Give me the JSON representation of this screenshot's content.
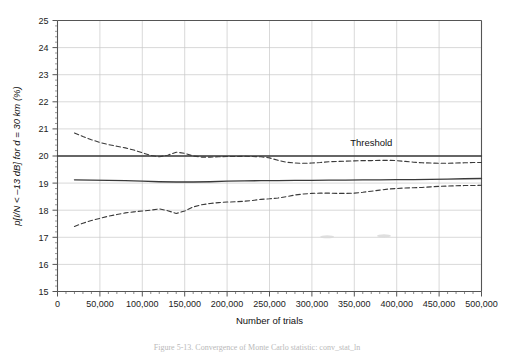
{
  "figure": {
    "caption": "Figure 5-13.  Convergence of Monte Carlo statistic: conv_stat_ln",
    "background_color": "#ffffff"
  },
  "chart_data": {
    "type": "line",
    "title": "",
    "subtitle": "",
    "xlabel": "Number of trials",
    "ylabel": "p[I/N < –13 dB] for d = 30 km (%)",
    "xlim": [
      0,
      500000
    ],
    "ylim": [
      15,
      25
    ],
    "xticks": [
      0,
      50000,
      100000,
      150000,
      200000,
      250000,
      300000,
      350000,
      400000,
      450000,
      500000
    ],
    "xtick_labels": [
      "0",
      "50,000",
      "100,000",
      "150,000",
      "200,000",
      "250,000",
      "300,000",
      "350,000",
      "400,000",
      "450,000",
      "500,000"
    ],
    "x_minor_tick_step": 10000,
    "yticks": [
      15,
      16,
      17,
      18,
      19,
      20,
      21,
      22,
      23,
      24,
      25
    ],
    "ytick_labels": [
      "15",
      "16",
      "17",
      "18",
      "19",
      "20",
      "21",
      "22",
      "23",
      "24",
      "25"
    ],
    "y_minor_tick_step": 0.2,
    "grid": true,
    "grid_color": "#c8c8c8",
    "axis_color": "#555555",
    "legend": "none",
    "annotations": [
      {
        "name": "threshold-label",
        "text": "Threshold",
        "x": 370000,
        "y": 20.38
      }
    ],
    "series": [
      {
        "name": "Threshold",
        "style": "solid",
        "color": "#3a3a3a",
        "width": 1.3,
        "x": [
          0,
          500000
        ],
        "values": [
          20.0,
          20.0
        ]
      },
      {
        "name": "Mean estimate",
        "style": "solid",
        "color": "#3a3a3a",
        "width": 1.3,
        "x": [
          20000,
          40000,
          60000,
          80000,
          100000,
          120000,
          140000,
          160000,
          180000,
          200000,
          220000,
          240000,
          260000,
          280000,
          300000,
          320000,
          340000,
          360000,
          380000,
          400000,
          420000,
          440000,
          460000,
          480000,
          500000
        ],
        "values": [
          19.12,
          19.11,
          19.1,
          19.09,
          19.07,
          19.05,
          19.04,
          19.04,
          19.05,
          19.07,
          19.08,
          19.09,
          19.09,
          19.1,
          19.1,
          19.11,
          19.11,
          19.12,
          19.12,
          19.13,
          19.13,
          19.14,
          19.15,
          19.16,
          19.17
        ]
      },
      {
        "name": "Upper confidence bound",
        "style": "dashed",
        "color": "#3a3a3a",
        "width": 1.1,
        "x": [
          20000,
          30000,
          40000,
          50000,
          60000,
          70000,
          80000,
          90000,
          100000,
          110000,
          120000,
          130000,
          140000,
          150000,
          160000,
          170000,
          180000,
          190000,
          200000,
          210000,
          220000,
          230000,
          240000,
          250000,
          260000,
          270000,
          280000,
          290000,
          300000,
          310000,
          320000,
          330000,
          340000,
          350000,
          360000,
          370000,
          380000,
          390000,
          400000,
          410000,
          420000,
          430000,
          440000,
          450000,
          460000,
          470000,
          480000,
          490000,
          500000
        ],
        "values": [
          20.85,
          20.72,
          20.6,
          20.5,
          20.42,
          20.36,
          20.3,
          20.22,
          20.12,
          20.02,
          19.97,
          20.03,
          20.14,
          20.1,
          20.0,
          19.96,
          19.96,
          19.97,
          19.98,
          19.98,
          19.99,
          19.98,
          19.97,
          19.93,
          19.84,
          19.77,
          19.74,
          19.73,
          19.74,
          19.76,
          19.79,
          19.8,
          19.81,
          19.82,
          19.83,
          19.83,
          19.84,
          19.84,
          19.83,
          19.8,
          19.77,
          19.75,
          19.74,
          19.73,
          19.73,
          19.74,
          19.75,
          19.76,
          19.76
        ]
      },
      {
        "name": "Lower confidence bound",
        "style": "dashed",
        "color": "#3a3a3a",
        "width": 1.1,
        "x": [
          20000,
          30000,
          40000,
          50000,
          60000,
          70000,
          80000,
          90000,
          100000,
          110000,
          120000,
          130000,
          140000,
          150000,
          160000,
          170000,
          180000,
          190000,
          200000,
          210000,
          220000,
          230000,
          240000,
          250000,
          260000,
          270000,
          280000,
          290000,
          300000,
          310000,
          320000,
          330000,
          340000,
          350000,
          360000,
          370000,
          380000,
          390000,
          400000,
          410000,
          420000,
          430000,
          440000,
          450000,
          460000,
          470000,
          480000,
          490000,
          500000
        ],
        "values": [
          17.4,
          17.52,
          17.62,
          17.7,
          17.78,
          17.84,
          17.9,
          17.94,
          17.97,
          18.0,
          18.05,
          17.98,
          17.88,
          17.97,
          18.12,
          18.2,
          18.25,
          18.28,
          18.3,
          18.31,
          18.33,
          18.36,
          18.4,
          18.42,
          18.45,
          18.5,
          18.56,
          18.6,
          18.62,
          18.63,
          18.63,
          18.62,
          18.62,
          18.63,
          18.66,
          18.7,
          18.74,
          18.78,
          18.8,
          18.82,
          18.83,
          18.84,
          18.86,
          18.88,
          18.89,
          18.9,
          18.91,
          18.91,
          18.92
        ]
      }
    ],
    "artifacts": [
      {
        "name": "scan-speck-1",
        "x": 318000,
        "y": 17.02
      },
      {
        "name": "scan-speck-2",
        "x": 385000,
        "y": 17.05
      }
    ]
  }
}
